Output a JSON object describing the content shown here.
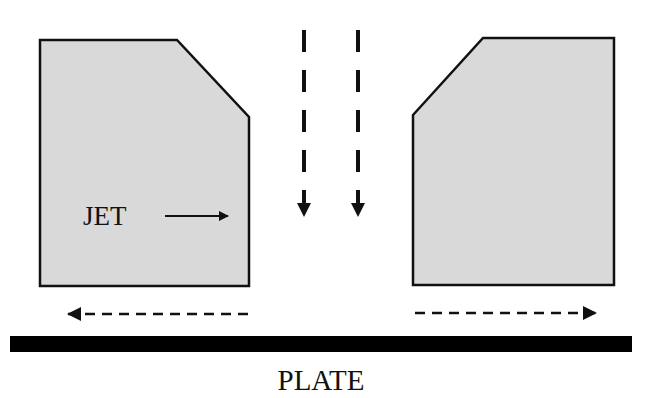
{
  "diagram": {
    "colors": {
      "block_fill": "#d9d9d9",
      "stroke": "#111111",
      "plate": "#000000",
      "background": "#ffffff"
    },
    "labels": {
      "jet": "JET",
      "plate": "PLATE"
    },
    "nodes": [
      {
        "id": "left-block",
        "shape": "chamfered-rect",
        "chamfer": "top-right"
      },
      {
        "id": "right-block",
        "shape": "chamfered-rect",
        "chamfer": "top-left"
      },
      {
        "id": "plate",
        "shape": "bar",
        "label": "PLATE"
      }
    ],
    "arrows": [
      {
        "id": "jet-arrow",
        "style": "solid",
        "direction": "right",
        "label": "JET"
      },
      {
        "id": "down-flow-left",
        "style": "dashed",
        "direction": "down"
      },
      {
        "id": "down-flow-right",
        "style": "dashed",
        "direction": "down"
      },
      {
        "id": "wall-flow-left",
        "style": "dashed",
        "direction": "left"
      },
      {
        "id": "wall-flow-right",
        "style": "dashed",
        "direction": "right"
      }
    ]
  }
}
